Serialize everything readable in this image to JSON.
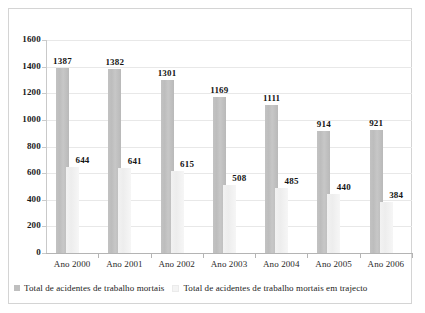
{
  "chart_data": {
    "type": "bar",
    "title": "",
    "subtitle": "",
    "xlabel": "",
    "ylabel": "",
    "ylim": [
      0,
      1600
    ],
    "ytick_step": 200,
    "yticks": [
      1600,
      1400,
      1200,
      1000,
      800,
      600,
      400,
      200,
      0
    ],
    "grid": true,
    "legend_position": "bottom-left",
    "categories": [
      "Ano 2000",
      "Ano 2001",
      "Ano 2002",
      "Ano 2003",
      "Ano 2004",
      "Ano 2005",
      "Ano 2006"
    ],
    "series": [
      {
        "name": "Total de acidentes de trabalho mortais",
        "color": "#bfbfbf",
        "values": [
          1387,
          1382,
          1301,
          1169,
          1111,
          914,
          921
        ]
      },
      {
        "name": "Total de acidentes de trabalho mortais em trajecto",
        "color": "#f2f2f2",
        "values": [
          644,
          641,
          615,
          508,
          485,
          440,
          384
        ]
      }
    ]
  },
  "legend": {
    "entries": [
      {
        "label": "Total de acidentes de trabalho mortais",
        "swatch": "dark"
      },
      {
        "label": "Total de acidentes de trabalho mortais em trajecto",
        "swatch": "light"
      }
    ]
  },
  "colors": {
    "series_dark": "#bfbfbf",
    "series_light": "#f2f2f2",
    "axis": "#b4b4b4",
    "grid": "#e8e8e8",
    "frame": "#d4d4d4",
    "text": "#1a1a1a",
    "background": "#ffffff"
  }
}
